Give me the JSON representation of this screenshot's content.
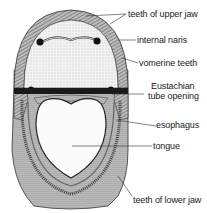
{
  "diagram": {
    "labels": [
      {
        "id": "teeth-upper-jaw",
        "text": "teeth of upper jaw"
      },
      {
        "id": "internal-naris",
        "text": "internal naris"
      },
      {
        "id": "vomerine-teeth",
        "text": "vomerine teeth"
      },
      {
        "id": "eustachian-1",
        "text": "Eustachian"
      },
      {
        "id": "eustachian-2",
        "text": "tube opening"
      },
      {
        "id": "esophagus",
        "text": "esophagus"
      },
      {
        "id": "tongue",
        "text": "tongue"
      },
      {
        "id": "teeth-lower-jaw",
        "text": "teeth of lower jaw"
      }
    ],
    "colors": {
      "ink": "#222222",
      "shade": "#8a8a8a",
      "paper": "#ffffff"
    }
  }
}
